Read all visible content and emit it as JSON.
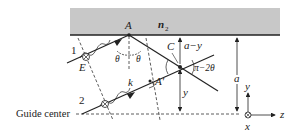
{
  "diagram": {
    "medium_label": "n",
    "medium_subscript": "2",
    "point_A": "A",
    "point_A_prime": "A′",
    "point_C": "C",
    "point_E": "E",
    "ray_1_label": "1",
    "ray_2_label": "2",
    "wavevector_label": "k",
    "angle_theta_left": "θ",
    "angle_theta_right": "θ",
    "angle_pi_minus_2theta": "π−2θ",
    "dist_a_minus_y": "a−y",
    "dist_y": "y",
    "dist_a": "a",
    "guide_center_label": "Guide center",
    "axes": {
      "y_label": "y",
      "z_label": "z",
      "x_label": "x",
      "x_symbol": "⊗"
    },
    "colors": {
      "slab_fill": "#c8c8c8",
      "line": "#222222"
    }
  }
}
